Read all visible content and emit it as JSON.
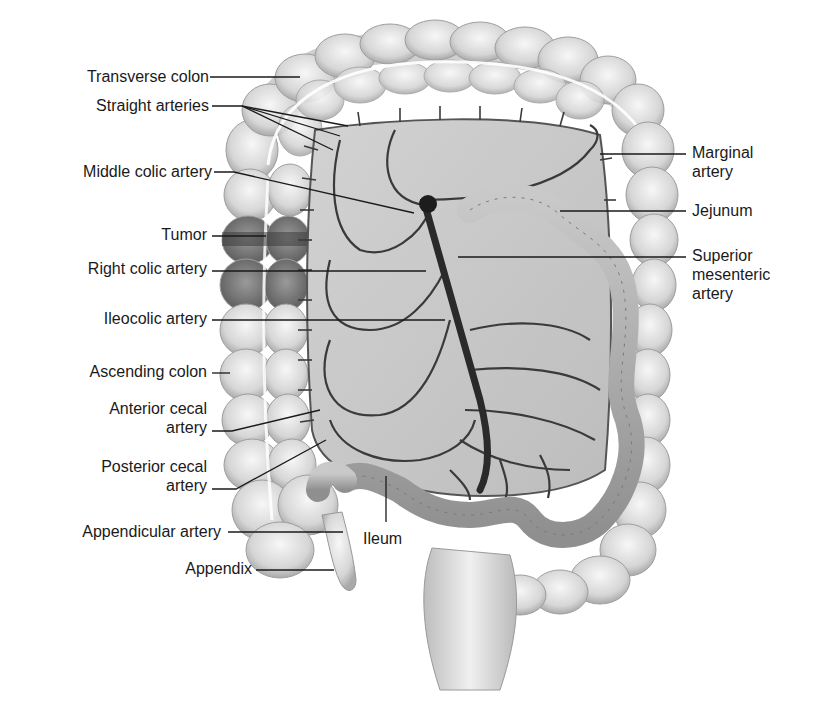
{
  "figure": {
    "labels_left": [
      {
        "id": "transverse-colon",
        "lines": [
          "Transverse colon"
        ]
      },
      {
        "id": "straight-arteries",
        "lines": [
          "Straight arteries"
        ]
      },
      {
        "id": "middle-colic-artery",
        "lines": [
          "Middle colic artery"
        ]
      },
      {
        "id": "tumor",
        "lines": [
          "Tumor"
        ]
      },
      {
        "id": "right-colic-artery",
        "lines": [
          "Right colic artery"
        ]
      },
      {
        "id": "ileocolic-artery",
        "lines": [
          "Ileocolic artery"
        ]
      },
      {
        "id": "ascending-colon",
        "lines": [
          "Ascending colon"
        ]
      },
      {
        "id": "anterior-cecal-artery",
        "lines": [
          "Anterior cecal",
          "artery"
        ]
      },
      {
        "id": "posterior-cecal-artery",
        "lines": [
          "Posterior cecal",
          "artery"
        ]
      },
      {
        "id": "appendicular-artery",
        "lines": [
          "Appendicular artery"
        ]
      },
      {
        "id": "appendix",
        "lines": [
          "Appendix"
        ]
      }
    ],
    "labels_right": [
      {
        "id": "marginal-artery",
        "lines": [
          "Marginal",
          "artery"
        ]
      },
      {
        "id": "jejunum",
        "lines": [
          "Jejunum"
        ]
      },
      {
        "id": "superior-mesenteric-artery",
        "lines": [
          "Superior",
          "mesenteric",
          "artery"
        ]
      }
    ],
    "labels_inner": [
      {
        "id": "ileum",
        "lines": [
          "Ileum"
        ]
      }
    ]
  }
}
